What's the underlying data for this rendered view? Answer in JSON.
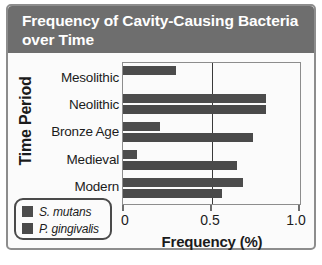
{
  "chart_data": {
    "type": "bar",
    "orientation": "horizontal",
    "title": "Frequency of Cavity-Causing Bacteria over Time",
    "xlabel": "Frequency (%)",
    "ylabel": "Time Period",
    "categories": [
      "Mesolithic",
      "Neolithic",
      "Bronze Age",
      "Medieval",
      "Modern"
    ],
    "series": [
      {
        "name": "S. mutans",
        "values": [
          0.3,
          0.81,
          0.21,
          0.08,
          0.68
        ]
      },
      {
        "name": "P. gingivalis",
        "values": [
          0.0,
          0.81,
          0.74,
          0.65,
          0.56
        ]
      }
    ],
    "xlim": [
      0,
      1.0
    ],
    "xticks": [
      "0",
      "0.5",
      "1.0"
    ],
    "xtick_values": [
      0,
      0.5,
      1.0
    ],
    "grid": false,
    "legend_position": "bottom-left",
    "colors": {
      "s_mutans": "#4c4c4c",
      "p_gingivalis": "#4a4a4a",
      "title_banner": "#6e6e6e",
      "frame": "#8d8d8d",
      "plot_background": "#fbfbfb",
      "axis_line": "#3a3a3a"
    }
  }
}
